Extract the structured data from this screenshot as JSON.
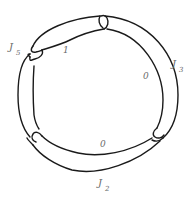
{
  "diagram": {
    "bands": [
      {
        "id": "J5",
        "label_main": "J",
        "label_sub": "5",
        "framing": "1",
        "position": "upper-left"
      },
      {
        "id": "J3",
        "label_main": "J",
        "label_sub": "3",
        "framing": "0",
        "position": "right"
      },
      {
        "id": "J2",
        "label_main": "J",
        "label_sub": "2",
        "framing": "0",
        "position": "bottom"
      }
    ],
    "clasps": [
      "top",
      "left",
      "lower-left",
      "lower-right"
    ],
    "colors": {
      "stroke": "#1a1a1a",
      "label": "#6a6a6a",
      "background": "#ffffff"
    }
  }
}
